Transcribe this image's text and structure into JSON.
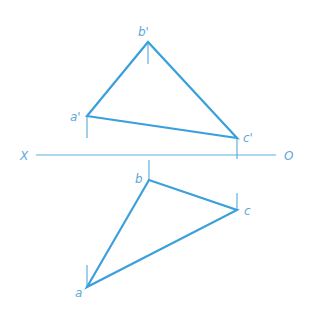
{
  "diagram": {
    "type": "orthographic projection of triangle",
    "colors": {
      "edge": "#3aa0dc",
      "axis": "#5fb0e0",
      "label": "#5fa8d8",
      "background": "#ffffff"
    },
    "axis": {
      "left_label": "X",
      "right_label": "O"
    },
    "front_view": {
      "points": [
        {
          "label": "a'",
          "x": 87,
          "y": 116
        },
        {
          "label": "b'",
          "x": 148,
          "y": 42
        },
        {
          "label": "c'",
          "x": 237,
          "y": 138
        }
      ]
    },
    "top_view": {
      "points": [
        {
          "label": "a",
          "x": 87,
          "y": 287
        },
        {
          "label": "b",
          "x": 149,
          "y": 180
        },
        {
          "label": "c",
          "x": 237,
          "y": 210
        }
      ]
    }
  }
}
